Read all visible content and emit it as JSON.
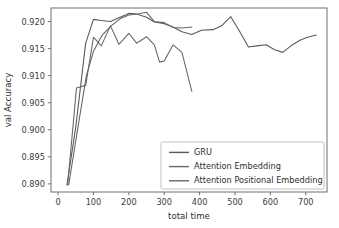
{
  "chart_data": {
    "type": "line",
    "title": "",
    "xlabel": "total time",
    "ylabel": "val Accuracy",
    "xlim": [
      -20,
      760
    ],
    "ylim": [
      0.8885,
      0.9225
    ],
    "xticks": [
      0,
      100,
      200,
      300,
      400,
      500,
      600,
      700
    ],
    "xticklabels": [
      "0",
      "100",
      "200",
      "300",
      "400",
      "500",
      "600",
      "700"
    ],
    "yticks": [
      0.89,
      0.895,
      0.9,
      0.905,
      0.91,
      0.915,
      0.92
    ],
    "yticklabels": [
      "0.890",
      "0.895",
      "0.900",
      "0.905",
      "0.910",
      "0.915",
      "0.920"
    ],
    "grid": false,
    "legend_position": "lower right",
    "series": [
      {
        "name": "GRU",
        "color": "#5a5a5a",
        "x": [
          25,
          50,
          78,
          100,
          122,
          148,
          172,
          200,
          222,
          250,
          272,
          300,
          325,
          350,
          378,
          405,
          438,
          462,
          488,
          512,
          538,
          562,
          588,
          612,
          635,
          660,
          685,
          705,
          730
        ],
        "y": [
          0.8898,
          0.9005,
          0.916,
          0.9204,
          0.9202,
          0.92,
          0.9207,
          0.9215,
          0.9214,
          0.9208,
          0.9199,
          0.9196,
          0.919,
          0.9181,
          0.9176,
          0.9184,
          0.9185,
          0.9192,
          0.9209,
          0.9183,
          0.9153,
          0.9155,
          0.9157,
          0.9148,
          0.9143,
          0.9156,
          0.9166,
          0.9171,
          0.9175
        ]
      },
      {
        "name": "Attention Embedding",
        "color": "#6a6a6a",
        "x": [
          27,
          52,
          78,
          100,
          122,
          148,
          172,
          200,
          222,
          250,
          272,
          287,
          300,
          325,
          350,
          378
        ],
        "y": [
          0.8898,
          0.9077,
          0.9082,
          0.9171,
          0.9155,
          0.9192,
          0.9158,
          0.9178,
          0.916,
          0.9172,
          0.9157,
          0.9125,
          0.9127,
          0.9157,
          0.9143,
          0.9071
        ]
      },
      {
        "name": "Attention Positional Embedding",
        "color": "#666666",
        "x": [
          30,
          55,
          80,
          100,
          125,
          150,
          175,
          200,
          225,
          250,
          272,
          300,
          325,
          350,
          378
        ],
        "y": [
          0.8898,
          0.9,
          0.91,
          0.9145,
          0.9175,
          0.9192,
          0.9205,
          0.9212,
          0.9214,
          0.9217,
          0.92,
          0.9198,
          0.9189,
          0.9188,
          0.919
        ]
      }
    ]
  },
  "legend": {
    "items": [
      {
        "label": "GRU"
      },
      {
        "label": "Attention Embedding"
      },
      {
        "label": "Attention Positional Embedding"
      }
    ]
  },
  "axes": {
    "x_title": "total time",
    "y_title": "val Accuracy"
  }
}
